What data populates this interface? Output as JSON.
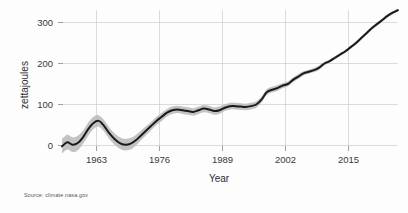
{
  "source_note": "Source: climate.nasa.gov",
  "axes": {
    "ylabel": "zettajoules",
    "xlabel": "Year",
    "y_ticks": [
      "0",
      "100",
      "200",
      "300"
    ],
    "x_ticks": [
      "1963",
      "1976",
      "1989",
      "2002",
      "2015"
    ]
  },
  "chart_data": {
    "type": "line",
    "title": "",
    "xlabel": "Year",
    "ylabel": "zettajoules",
    "xlim": [
      1957,
      2021
    ],
    "ylim": [
      -30,
      345
    ],
    "grid": true,
    "legend": "none",
    "annotations": [
      "Source: climate.nasa.gov"
    ],
    "xtick_values": [
      1963,
      1976,
      1989,
      2002,
      2015
    ],
    "ytick_values": [
      0,
      100,
      200,
      300
    ],
    "x": [
      1957,
      1958,
      1959,
      1960,
      1961,
      1962,
      1963,
      1964,
      1965,
      1966,
      1967,
      1968,
      1969,
      1970,
      1971,
      1972,
      1973,
      1974,
      1975,
      1976,
      1977,
      1978,
      1979,
      1980,
      1981,
      1982,
      1983,
      1984,
      1985,
      1986,
      1987,
      1988,
      1989,
      1990,
      1991,
      1992,
      1993,
      1994,
      1995,
      1996,
      1997,
      1998,
      1999,
      2000,
      2001,
      2002,
      2003,
      2004,
      2005,
      2006,
      2007,
      2008,
      2009,
      2010,
      2011,
      2012,
      2013,
      2014,
      2015,
      2016,
      2017,
      2018,
      2019,
      2020,
      2021
    ],
    "series": [
      {
        "name": "Ocean heat content",
        "values": [
          -2,
          8,
          2,
          6,
          20,
          40,
          55,
          60,
          48,
          30,
          16,
          6,
          2,
          4,
          12,
          24,
          36,
          48,
          60,
          70,
          80,
          86,
          88,
          86,
          84,
          82,
          86,
          90,
          88,
          84,
          86,
          92,
          96,
          96,
          95,
          94,
          96,
          100,
          112,
          130,
          136,
          140,
          146,
          150,
          160,
          168,
          176,
          180,
          184,
          190,
          200,
          206,
          214,
          222,
          230,
          240,
          250,
          262,
          274,
          286,
          296,
          306,
          316,
          324,
          330
        ]
      },
      {
        "name": "Uncertainty band (upper)",
        "values": [
          16,
          26,
          20,
          24,
          36,
          56,
          70,
          74,
          62,
          44,
          30,
          20,
          16,
          18,
          25,
          36,
          47,
          58,
          70,
          80,
          89,
          95,
          97,
          95,
          93,
          91,
          95,
          99,
          97,
          93,
          95,
          100,
          104,
          104,
          103,
          102,
          104,
          108,
          119,
          137,
          143,
          147,
          152,
          156,
          166,
          174,
          181,
          185,
          189,
          195,
          204,
          210,
          218,
          226,
          234,
          244,
          254,
          266,
          278,
          290,
          300,
          310,
          320,
          328,
          334
        ]
      },
      {
        "name": "Uncertainty band (lower)",
        "values": [
          -20,
          -10,
          -16,
          -12,
          4,
          24,
          40,
          46,
          34,
          16,
          2,
          -8,
          -12,
          -10,
          -1,
          12,
          25,
          38,
          50,
          60,
          71,
          77,
          79,
          77,
          75,
          73,
          77,
          81,
          79,
          75,
          77,
          84,
          88,
          88,
          87,
          86,
          88,
          92,
          105,
          123,
          129,
          133,
          140,
          144,
          154,
          162,
          171,
          175,
          179,
          185,
          196,
          202,
          210,
          218,
          226,
          236,
          246,
          258,
          270,
          282,
          292,
          302,
          312,
          320,
          326
        ]
      }
    ]
  }
}
